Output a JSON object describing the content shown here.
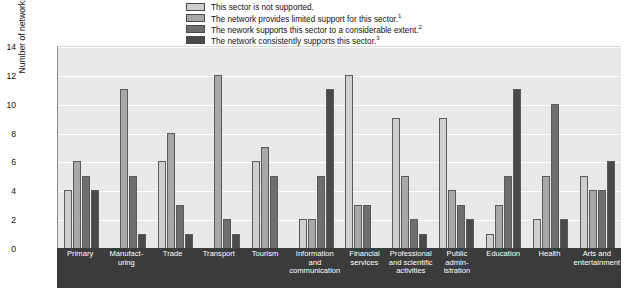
{
  "chart_data": {
    "type": "bar",
    "title": "",
    "xlabel": "",
    "ylabel": "Number of networks",
    "ylim": [
      0,
      14
    ],
    "yticks": [
      0,
      2,
      4,
      6,
      8,
      10,
      12,
      14
    ],
    "grid": true,
    "legend_position": "top",
    "categories": [
      "Primary",
      "Manufact-\nuring",
      "Trade",
      "Transport",
      "Tourism",
      "Information\nand\ncommunication",
      "Financial\nservices",
      "Professional\nand scientific\nactivities",
      "Public\nadmin-\nistration",
      "Education",
      "Health",
      "Arts and\nentertainment"
    ],
    "series": [
      {
        "name": "This sector is not supported.",
        "color": "#cfcfcf",
        "values": [
          4,
          0,
          6,
          0,
          6,
          2,
          12,
          9,
          9,
          1,
          2,
          5
        ]
      },
      {
        "name": "The network provides limited support for this sector.",
        "footnote": "1",
        "color": "#a8a8a8",
        "values": [
          6,
          11,
          8,
          12,
          7,
          2,
          3,
          5,
          4,
          3,
          5,
          4
        ]
      },
      {
        "name": "The nework supports this sector to a considerable extent.",
        "footnote": "2",
        "color": "#6e6e6e",
        "values": [
          5,
          5,
          3,
          2,
          5,
          5,
          3,
          2,
          3,
          5,
          10,
          4
        ]
      },
      {
        "name": "The network consistently supports this sector.",
        "footnote": "3",
        "color": "#4a4a4a",
        "values": [
          4,
          1,
          1,
          1,
          0,
          11,
          0,
          1,
          2,
          11,
          2,
          6
        ]
      }
    ]
  },
  "axis": {
    "y_title": "Number of networks",
    "y_labels": [
      "14",
      "12",
      "10",
      "8",
      "6",
      "4",
      "2",
      "0"
    ]
  },
  "x_labels": [
    [
      "Primary"
    ],
    [
      "Manufact-",
      "uring"
    ],
    [
      "Trade"
    ],
    [
      "Transport"
    ],
    [
      "Tourism"
    ],
    [
      "Information",
      "and",
      "communication"
    ],
    [
      "Financial",
      "services"
    ],
    [
      "Professional",
      "and scientific",
      "activities"
    ],
    [
      "Public",
      "admin-",
      "istration"
    ],
    [
      "Education"
    ],
    [
      "Health"
    ],
    [
      "Arts and",
      "entertainment"
    ]
  ],
  "colors": {
    "plot_background": "#e9e9e9",
    "x_band_background": "#3b3b3b",
    "gridline": "#ffffff",
    "bar_outline": "#5b5b5b"
  }
}
